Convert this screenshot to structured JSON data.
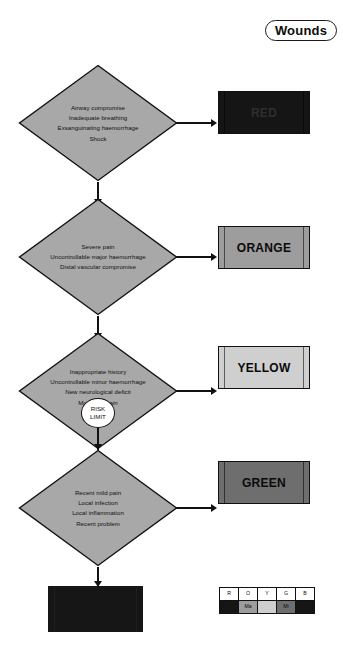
{
  "title": {
    "label": "Wounds"
  },
  "nodes": [
    {
      "id": "red",
      "lines": [
        "Airway compromise",
        "Inadequate breathing",
        "Exsanguinating haemorrhage",
        "Shock"
      ],
      "result_label": "RED",
      "result_color": "#151515"
    },
    {
      "id": "orange",
      "lines": [
        "Severe pain",
        "Uncontrollable major haemorrhage",
        "Distal vascular compromise"
      ],
      "result_label": "ORANGE",
      "result_color": "#9d9d9d"
    },
    {
      "id": "yellow",
      "lines": [
        "Inappropriate history",
        "Uncontrollable minor haemorrhage",
        "New neurological deficit",
        "Moderate pain"
      ],
      "result_label": "YELLOW",
      "result_color": "#cfcfcf"
    },
    {
      "id": "green",
      "lines": [
        "Recent mild pain",
        "Local infection",
        "Local inflammation",
        "Recent problem"
      ],
      "result_label": "GREEN",
      "result_color": "#6e6e6e"
    }
  ],
  "risk_limit": {
    "line1": "RISK",
    "line2": "LIMIT"
  },
  "final_box": {
    "label": "BLUE",
    "color": "#161616"
  },
  "legend": {
    "headers": [
      "R",
      "O",
      "Y",
      "G",
      "B"
    ],
    "values": [
      "",
      "Ma",
      "",
      "Mi",
      ""
    ],
    "colors": [
      "#151515",
      "#9d9d9d",
      "#cfcfcf",
      "#6e6e6e",
      "#151515"
    ]
  }
}
